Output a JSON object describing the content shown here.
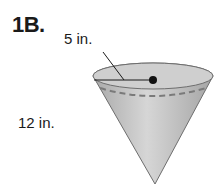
{
  "problem": {
    "label": "1B."
  },
  "figure": {
    "shape": "cone",
    "radius_label": "5 in.",
    "slant_height_label": "12 in.",
    "colors": {
      "cone_fill": "#bdbdbd",
      "top_fill": "#d2d2d2",
      "outline": "#6e6e6e",
      "dashed_line": "#7a7a7a",
      "center_dot": "#111111"
    }
  }
}
